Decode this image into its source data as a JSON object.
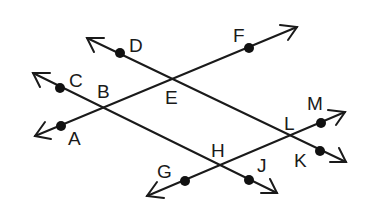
{
  "diagram": {
    "type": "geometry-lines",
    "lines": [
      {
        "id": "line-AF",
        "points": [
          "A",
          "B",
          "E",
          "F"
        ],
        "from": [
          35,
          136
        ],
        "to": [
          297,
          27
        ]
      },
      {
        "id": "line-DK",
        "points": [
          "D",
          "E",
          "L",
          "K"
        ],
        "from": [
          87,
          38
        ],
        "to": [
          346,
          162
        ]
      },
      {
        "id": "line-CJ",
        "points": [
          "C",
          "B",
          "H",
          "J"
        ],
        "from": [
          33,
          73
        ],
        "to": [
          277,
          193
        ]
      },
      {
        "id": "line-GM",
        "points": [
          "G",
          "H",
          "L",
          "M"
        ],
        "from": [
          147,
          196
        ],
        "to": [
          345,
          112
        ]
      }
    ],
    "labels": {
      "A": "A",
      "B": "B",
      "C": "C",
      "D": "D",
      "E": "E",
      "F": "F",
      "G": "G",
      "H": "H",
      "J": "J",
      "K": "K",
      "L": "L",
      "M": "M"
    },
    "dots": [
      {
        "name": "A",
        "x": 61,
        "y": 126
      },
      {
        "name": "C",
        "x": 60,
        "y": 88
      },
      {
        "name": "D",
        "x": 120,
        "y": 53
      },
      {
        "name": "F",
        "x": 249,
        "y": 48
      },
      {
        "name": "G",
        "x": 185,
        "y": 181
      },
      {
        "name": "J",
        "x": 249,
        "y": 180
      },
      {
        "name": "K",
        "x": 320,
        "y": 151
      },
      {
        "name": "M",
        "x": 321,
        "y": 123
      }
    ],
    "intersections": [
      {
        "name": "B",
        "lines": [
          "line-AF",
          "line-CJ"
        ]
      },
      {
        "name": "E",
        "lines": [
          "line-AF",
          "line-DK"
        ]
      },
      {
        "name": "H",
        "lines": [
          "line-CJ",
          "line-GM"
        ]
      },
      {
        "name": "L",
        "lines": [
          "line-DK",
          "line-GM"
        ]
      }
    ],
    "colors": {
      "ink": "#1a1a1a",
      "background": "#ffffff"
    }
  }
}
